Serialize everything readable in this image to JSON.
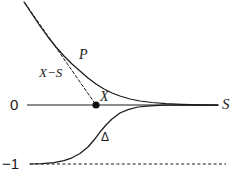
{
  "figure": {
    "background_color": "#ffffff",
    "stroke_color": "#1a1a1a",
    "width": 240,
    "height": 179,
    "labels": {
      "zero": "0",
      "axis_right": "S",
      "minus_one": "−1",
      "curve_p": "P",
      "chord": "X−S",
      "point": "X",
      "curve_delta": "Δ"
    }
  },
  "chart_data": {
    "type": "line",
    "title": "",
    "xlabel": "S",
    "ylabel": "",
    "grid": false,
    "legend": "none",
    "xlim": [
      0,
      240
    ],
    "ylim": [
      -1,
      1.2
    ],
    "axes": {
      "horizontal_axis": {
        "label": "S",
        "value": 0,
        "label_left": "0",
        "pixel_y": 105,
        "x_start": 27,
        "x_end": 218
      },
      "asymptote_line": {
        "label": "−1",
        "value": -1,
        "style": "dashed",
        "pixel_y": 164,
        "x_start": 30,
        "x_end": 226
      }
    },
    "series": [
      {
        "name": "P",
        "style": "solid",
        "description": "convex decreasing curve asymptotic to 0 from above",
        "label": "P",
        "points": [
          [
            24,
            2
          ],
          [
            32,
            14
          ],
          [
            40,
            26
          ],
          [
            48,
            37
          ],
          [
            56,
            47
          ],
          [
            64,
            56
          ],
          [
            72,
            64
          ],
          [
            80,
            71
          ],
          [
            88,
            78
          ],
          [
            96,
            84
          ],
          [
            104,
            89
          ],
          [
            112,
            93
          ],
          [
            120,
            96
          ],
          [
            130,
            99
          ],
          [
            140,
            101
          ],
          [
            152,
            102.5
          ],
          [
            166,
            103.6
          ],
          [
            182,
            104.3
          ],
          [
            200,
            104.8
          ],
          [
            218,
            105
          ]
        ]
      },
      {
        "name": "X-S",
        "style": "dashed",
        "description": "straight chord from curve start down to point X on the axis",
        "label": "X−S",
        "points": [
          [
            25,
            3
          ],
          [
            96,
            105
          ]
        ]
      },
      {
        "name": "Delta",
        "style": "solid",
        "description": "sigmoid rising from -1 to 0 asymptotically",
        "label": "Δ",
        "points": [
          [
            30,
            164
          ],
          [
            42,
            163.6
          ],
          [
            54,
            162.6
          ],
          [
            64,
            160.6
          ],
          [
            72,
            157.8
          ],
          [
            80,
            153.5
          ],
          [
            88,
            147
          ],
          [
            94,
            140
          ],
          [
            100,
            132
          ],
          [
            106,
            125
          ],
          [
            112,
            119
          ],
          [
            120,
            113
          ],
          [
            128,
            109.6
          ],
          [
            138,
            107
          ],
          [
            150,
            105.8
          ],
          [
            164,
            105.2
          ],
          [
            182,
            105.02
          ],
          [
            200,
            105
          ],
          [
            218,
            105
          ]
        ]
      }
    ],
    "markers": [
      {
        "name": "X",
        "label": "X",
        "shape": "filled-circle",
        "x_pixel": 96,
        "y_pixel": 105,
        "value": [
          96,
          0
        ]
      }
    ],
    "annotations": [
      {
        "text": "P",
        "x_pixel": 84,
        "y_pixel": 55
      },
      {
        "text": "X−S",
        "x_pixel": 52,
        "y_pixel": 73
      },
      {
        "text": "X",
        "x_pixel": 105,
        "y_pixel": 97
      },
      {
        "text": "Δ",
        "x_pixel": 105,
        "y_pixel": 137
      },
      {
        "text": "0",
        "x_pixel": 14,
        "y_pixel": 105
      },
      {
        "text": "S",
        "x_pixel": 226,
        "y_pixel": 105
      },
      {
        "text": "−1",
        "x_pixel": 10,
        "y_pixel": 164
      }
    ]
  }
}
